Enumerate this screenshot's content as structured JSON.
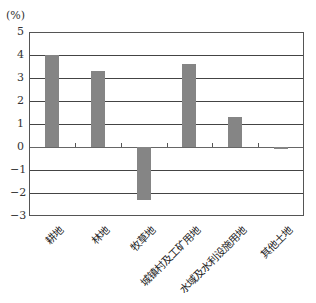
{
  "chart_data": {
    "type": "bar",
    "title": "",
    "ylabel": "(%)",
    "xlabel": "",
    "ylim": [
      -3,
      5
    ],
    "yticks": [
      5,
      4,
      3,
      2,
      1,
      0,
      -1,
      -2,
      -3
    ],
    "grid": true,
    "categories": [
      "耕地",
      "林地",
      "牧草地",
      "城镇村及工矿用地",
      "水域及水利设施用地",
      "其他土地"
    ],
    "values": [
      4.0,
      3.3,
      -2.3,
      3.6,
      1.3,
      -0.05
    ],
    "bar_color": "#858585"
  }
}
